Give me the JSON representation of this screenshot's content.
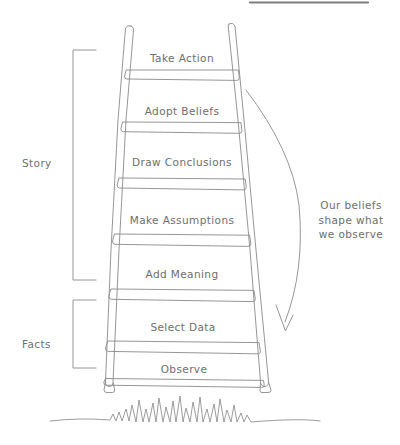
{
  "diagram": {
    "ink_color": "#8a8a8a",
    "text_color": "#6e6e6e",
    "background": "#ffffff"
  },
  "ladder": {
    "rungs": [
      {
        "label": "Take Action",
        "group": "story"
      },
      {
        "label": "Adopt Beliefs",
        "group": "story"
      },
      {
        "label": "Draw Conclusions",
        "group": "story"
      },
      {
        "label": "Make Assumptions",
        "group": "story"
      },
      {
        "label": "Add Meaning",
        "group": "story"
      },
      {
        "label": "Select Data",
        "group": "facts"
      },
      {
        "label": "Observe",
        "group": "facts"
      }
    ]
  },
  "groups": {
    "story_label": "Story",
    "facts_label": "Facts"
  },
  "annotation": {
    "text": "Our beliefs shape what we observe",
    "line1": "Our beliefs",
    "line2": "shape what",
    "line3": "we observe"
  },
  "decor": {
    "grass_name": "grass-squiggle",
    "arrow_name": "feedback-arrow",
    "top_rule_name": "top-edge-rule"
  }
}
